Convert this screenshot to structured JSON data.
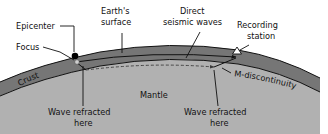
{
  "figure": {
    "background_color": "#ffffff",
    "width": 328,
    "height": 134
  },
  "layers": [
    {
      "id": "crust",
      "label": "Crust",
      "color": "#767676",
      "label_color": "#111111"
    },
    {
      "id": "mantle",
      "label": "Mantle",
      "color": "#b1b1b1",
      "label_color": "#111111"
    }
  ],
  "labels": {
    "epicenter": "Epicenter",
    "focus": "Focus",
    "earths_surface_line1": "Earth's",
    "earths_surface_line2": "surface",
    "direct_waves_line1": "Direct",
    "direct_waves_line2": "seismic waves",
    "recording_station_line1": "Recording",
    "recording_station_line2": "station",
    "m_discontinuity": "M-discontinuity",
    "crust": "Crust",
    "mantle": "Mantle",
    "wave_refracted_left_line1": "Wave refracted",
    "wave_refracted_left_line2": "here",
    "wave_refracted_right_line1": "Wave refracted",
    "wave_refracted_right_line2": "here"
  },
  "markers": {
    "epicenter": {
      "name": "epicenter-dot",
      "shape": "filled-circle",
      "color": "#000000"
    },
    "focus": {
      "name": "focus-dot",
      "shape": "small-circle",
      "color": "#cfcfcf"
    },
    "recording_station": {
      "name": "recording-station-triangle",
      "shape": "open-triangle",
      "color": "#ffffff"
    }
  },
  "rays": [
    {
      "id": "direct-seismic-wave",
      "style": "solid",
      "color": "#111111",
      "arrow": true,
      "description": "Direct seismic wave travelling through the crust from focus to recording station"
    },
    {
      "id": "refracted-wave",
      "style": "dashed",
      "color": "#3a3a3a",
      "arrow": true,
      "description": "Wave refracted along the M-discontinuity"
    }
  ],
  "colors": {
    "crust_fill": "#767676",
    "mantle_fill": "#b1b1b1",
    "sky_fill": "#ffffff",
    "line": "#111111",
    "text": "#111111"
  }
}
